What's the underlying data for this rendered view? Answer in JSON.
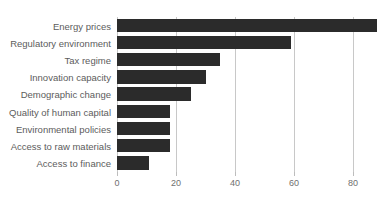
{
  "chart_data": {
    "type": "bar",
    "orientation": "horizontal",
    "title": "",
    "subtitle": "",
    "xlabel": "",
    "ylabel": "",
    "categories": [
      "Energy prices",
      "Regulatory environment",
      "Tax regime",
      "Innovation capacity",
      "Demographic change",
      "Quality of human capital",
      "Environmental policies",
      "Access to raw materials",
      "Access to finance"
    ],
    "values": [
      88,
      59,
      35,
      30,
      25,
      18,
      18,
      18,
      11
    ],
    "xlim": [
      0,
      92
    ],
    "xticks": [
      0,
      20,
      40,
      60,
      80
    ],
    "xtick_labels": [
      "0",
      "20",
      "40",
      "60",
      "80"
    ],
    "grid": "vertical",
    "legend": "none",
    "bar_color": "#2b2b2b",
    "grid_color": "#c8c8c8",
    "label_color": "#5c5c5c",
    "tick_color": "#6f6f6f",
    "background": "#ffffff"
  },
  "axis": {
    "ticks": [
      {
        "label": "0",
        "value": 0
      },
      {
        "label": "20",
        "value": 20
      },
      {
        "label": "40",
        "value": 40
      },
      {
        "label": "60",
        "value": 60
      },
      {
        "label": "80",
        "value": 80
      }
    ]
  }
}
